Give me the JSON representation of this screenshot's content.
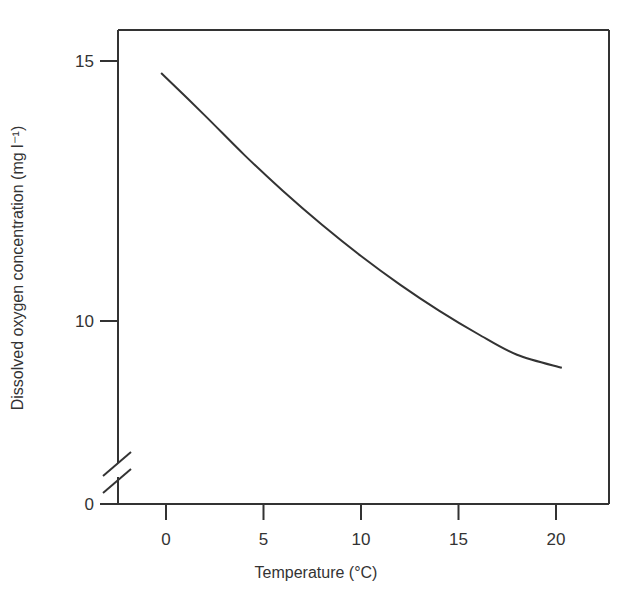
{
  "chart_data": {
    "type": "line",
    "title": "",
    "xlabel": "Temperature (°C)",
    "ylabel": "Dissolved oxygen concentration (mg l⁻¹)",
    "xlim": [
      -0.3,
      22.5
    ],
    "ylim": [
      0,
      15.6
    ],
    "x_ticks": [
      0,
      5,
      10,
      15,
      20
    ],
    "y_ticks": [
      0,
      10,
      15
    ],
    "y_axis_break": true,
    "grid": false,
    "legend": null,
    "series": [
      {
        "name": "Dissolved oxygen saturation",
        "color": "#333333",
        "x": [
          -0.25,
          2,
          4,
          6,
          8,
          10,
          12,
          14,
          16,
          18,
          20.3
        ],
        "y": [
          14.77,
          13.95,
          13.2,
          12.5,
          11.85,
          11.25,
          10.7,
          10.2,
          9.75,
          9.35,
          9.1
        ]
      }
    ]
  }
}
